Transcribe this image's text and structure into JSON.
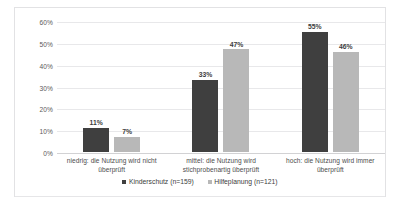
{
  "chart_data": {
    "type": "bar",
    "title": "",
    "xlabel": "",
    "ylabel": "",
    "ylim": [
      0,
      60
    ],
    "grid": true,
    "legend_position": "bottom",
    "categories": [
      "niedrig: die Nutzung wird nicht überprüft",
      "mittel: die Nutzung wird stichprobenartig überprüft",
      "hoch: die Nutzung wird immer überprüft"
    ],
    "yticks": [
      "0%",
      "10%",
      "20%",
      "30%",
      "40%",
      "50%",
      "60%"
    ],
    "ytick_values": [
      0,
      10,
      20,
      30,
      40,
      50,
      60
    ],
    "series": [
      {
        "name": "Kinderschutz (n=159)",
        "color": "#3f3f3f",
        "values": [
          11,
          33,
          55
        ],
        "labels": [
          "11%",
          "33%",
          "55%"
        ]
      },
      {
        "name": "Hilfeplanung (n=121)",
        "color": "#b8b8b8",
        "values": [
          7,
          47,
          46
        ],
        "labels": [
          "7%",
          "47%",
          "46%"
        ]
      }
    ]
  },
  "legend": {
    "items": [
      {
        "label": "Kinderschutz (n=159)"
      },
      {
        "label": "Hilfeplanung (n=121)"
      }
    ]
  },
  "title_remnant": "",
  "corner_mark": ""
}
